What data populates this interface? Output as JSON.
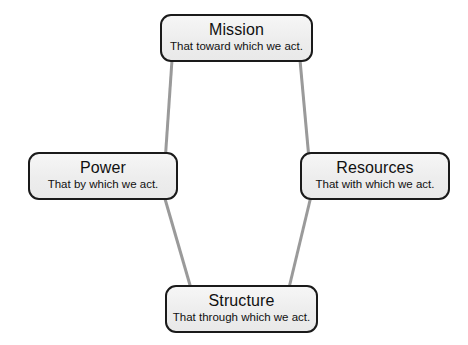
{
  "diagram": {
    "background_color": "#ffffff",
    "node_fill_color": "#ededed",
    "node_border_color": "#1a1a1a",
    "connector_color": "#9a9a9a",
    "connector_width": 3,
    "nodes": [
      {
        "id": "mission",
        "title": "Mission",
        "subtitle": "That toward which we act.",
        "position": "top"
      },
      {
        "id": "power",
        "title": "Power",
        "subtitle": "That by which we act.",
        "position": "left"
      },
      {
        "id": "resources",
        "title": "Resources",
        "subtitle": "That with which we act.",
        "position": "right"
      },
      {
        "id": "structure",
        "title": "Structure",
        "subtitle": "That through which we act.",
        "position": "bottom"
      }
    ],
    "connectors": [
      {
        "from": "mission",
        "to": "power"
      },
      {
        "from": "mission",
        "to": "resources"
      },
      {
        "from": "power",
        "to": "structure"
      },
      {
        "from": "resources",
        "to": "structure"
      }
    ]
  }
}
